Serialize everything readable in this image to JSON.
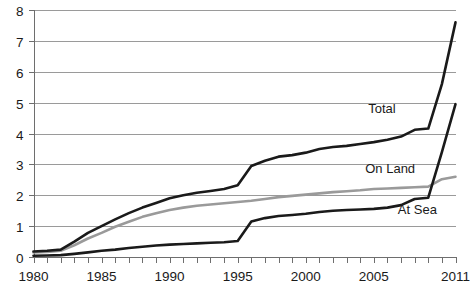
{
  "chart_data": {
    "type": "line",
    "title": "",
    "xlabel": "",
    "ylabel": "",
    "xlim": [
      1980,
      2011
    ],
    "ylim": [
      0,
      8
    ],
    "grid": true,
    "legend_position": "inline-right",
    "y_ticks": [
      0,
      1,
      2,
      3,
      4,
      5,
      6,
      7,
      8
    ],
    "y_tick_labels": [
      "0",
      "1",
      "2",
      "3",
      "4",
      "5",
      "6",
      "7",
      "8"
    ],
    "x_ticks": [
      1980,
      1981,
      1982,
      1983,
      1984,
      1985,
      1986,
      1987,
      1988,
      1989,
      1990,
      1991,
      1992,
      1993,
      1994,
      1995,
      1996,
      1997,
      1998,
      1999,
      2000,
      2001,
      2002,
      2003,
      2004,
      2005,
      2006,
      2007,
      2008,
      2009,
      2010,
      2011
    ],
    "x_tick_labels": [
      "1980",
      "1985",
      "1990",
      "1995",
      "2000",
      "2005",
      "2011"
    ],
    "x_tick_label_years": [
      1980,
      1985,
      1990,
      1995,
      2000,
      2005,
      2011
    ],
    "x": [
      1980,
      1981,
      1982,
      1983,
      1984,
      1985,
      1986,
      1987,
      1988,
      1989,
      1990,
      1991,
      1992,
      1993,
      1994,
      1995,
      1996,
      1997,
      1998,
      1999,
      2000,
      2001,
      2002,
      2003,
      2004,
      2005,
      2006,
      2007,
      2008,
      2009,
      2010,
      2011
    ],
    "series": [
      {
        "name": "Total",
        "color": "#1a1a1a",
        "width": 2.6,
        "label": "Total",
        "label_x": 2005.6,
        "label_y": 4.65,
        "values": [
          0.18,
          0.2,
          0.24,
          0.5,
          0.78,
          1.0,
          1.22,
          1.42,
          1.6,
          1.75,
          1.9,
          2.0,
          2.08,
          2.14,
          2.2,
          2.32,
          2.95,
          3.12,
          3.25,
          3.3,
          3.38,
          3.5,
          3.56,
          3.6,
          3.66,
          3.72,
          3.8,
          3.9,
          4.12,
          4.16,
          5.6,
          7.6
        ]
      },
      {
        "name": "On Land",
        "color": "#9a9a9a",
        "width": 2.6,
        "label": "On Land",
        "label_x": 2006.2,
        "label_y": 2.72,
        "values": [
          0.15,
          0.16,
          0.2,
          0.38,
          0.6,
          0.78,
          0.98,
          1.14,
          1.3,
          1.42,
          1.52,
          1.6,
          1.66,
          1.7,
          1.74,
          1.78,
          1.82,
          1.88,
          1.94,
          1.98,
          2.02,
          2.06,
          2.1,
          2.13,
          2.16,
          2.2,
          2.22,
          2.24,
          2.26,
          2.28,
          2.52,
          2.6
        ]
      },
      {
        "name": "At Sea",
        "color": "#1a1a1a",
        "width": 2.6,
        "label": "At Sea",
        "label_x": 2008.2,
        "label_y": 1.38,
        "values": [
          0.04,
          0.05,
          0.06,
          0.1,
          0.15,
          0.2,
          0.24,
          0.29,
          0.33,
          0.37,
          0.4,
          0.42,
          0.44,
          0.46,
          0.48,
          0.52,
          1.15,
          1.26,
          1.33,
          1.36,
          1.4,
          1.46,
          1.5,
          1.52,
          1.54,
          1.56,
          1.6,
          1.68,
          1.88,
          1.92,
          3.4,
          4.95
        ]
      }
    ]
  },
  "colors": {
    "gridline": "#9a9a9a",
    "axis": "#6e6e6e",
    "text": "#1a1a1a",
    "background": "#ffffff"
  }
}
